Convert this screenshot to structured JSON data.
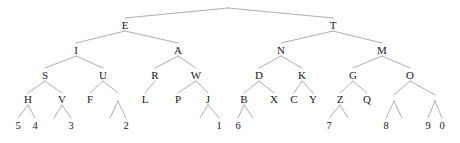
{
  "figure": {
    "type": "binary-tree-diagram",
    "width": 460,
    "height": 143,
    "background_color": "#ffffff",
    "edge_color": "#8b8b90",
    "text_color": "#16161a",
    "root_apex": {
      "x": 228,
      "y": 8
    },
    "levels_y": [
      8,
      25,
      50,
      75,
      99,
      125
    ],
    "nodes": [
      {
        "id": "E",
        "label": "E",
        "x": 125,
        "y": 25,
        "level": 1,
        "kind": "letter"
      },
      {
        "id": "T",
        "label": "T",
        "x": 333,
        "y": 25,
        "level": 1,
        "kind": "letter"
      },
      {
        "id": "I",
        "label": "I",
        "x": 76,
        "y": 50,
        "level": 2,
        "kind": "letter"
      },
      {
        "id": "A",
        "label": "A",
        "x": 178,
        "y": 50,
        "level": 2,
        "kind": "letter"
      },
      {
        "id": "N",
        "label": "N",
        "x": 281,
        "y": 50,
        "level": 2,
        "kind": "letter"
      },
      {
        "id": "M",
        "label": "M",
        "x": 382,
        "y": 50,
        "level": 2,
        "kind": "letter"
      },
      {
        "id": "S",
        "label": "S",
        "x": 45,
        "y": 75,
        "level": 3,
        "kind": "letter"
      },
      {
        "id": "U",
        "label": "U",
        "x": 103,
        "y": 75,
        "level": 3,
        "kind": "letter"
      },
      {
        "id": "R",
        "label": "R",
        "x": 155,
        "y": 75,
        "level": 3,
        "kind": "letter"
      },
      {
        "id": "W",
        "label": "W",
        "x": 196,
        "y": 75,
        "level": 3,
        "kind": "letter"
      },
      {
        "id": "D",
        "label": "D",
        "x": 259,
        "y": 75,
        "level": 3,
        "kind": "letter"
      },
      {
        "id": "K",
        "label": "K",
        "x": 302,
        "y": 75,
        "level": 3,
        "kind": "letter"
      },
      {
        "id": "G",
        "label": "G",
        "x": 353,
        "y": 75,
        "level": 3,
        "kind": "letter"
      },
      {
        "id": "O",
        "label": "O",
        "x": 410,
        "y": 75,
        "level": 3,
        "kind": "letter"
      },
      {
        "id": "H",
        "label": "H",
        "x": 28,
        "y": 99,
        "level": 4,
        "kind": "letter"
      },
      {
        "id": "V",
        "label": "V",
        "x": 62,
        "y": 99,
        "level": 4,
        "kind": "letter"
      },
      {
        "id": "F",
        "label": "F",
        "x": 90,
        "y": 99,
        "level": 4,
        "kind": "letter"
      },
      {
        "id": "n1",
        "label": "",
        "x": 118,
        "y": 99,
        "level": 4,
        "kind": "unlabeled"
      },
      {
        "id": "L",
        "label": "L",
        "x": 145,
        "y": 99,
        "level": 4,
        "kind": "letter"
      },
      {
        "id": "P",
        "label": "P",
        "x": 178,
        "y": 99,
        "level": 4,
        "kind": "letter"
      },
      {
        "id": "J",
        "label": "J",
        "x": 208,
        "y": 99,
        "level": 4,
        "kind": "letter"
      },
      {
        "id": "B",
        "label": "B",
        "x": 244,
        "y": 99,
        "level": 4,
        "kind": "letter"
      },
      {
        "id": "X",
        "label": "X",
        "x": 274,
        "y": 99,
        "level": 4,
        "kind": "letter"
      },
      {
        "id": "C",
        "label": "C",
        "x": 294,
        "y": 99,
        "level": 4,
        "kind": "letter"
      },
      {
        "id": "Y",
        "label": "Y",
        "x": 313,
        "y": 99,
        "level": 4,
        "kind": "letter"
      },
      {
        "id": "Z",
        "label": "Z",
        "x": 340,
        "y": 99,
        "level": 4,
        "kind": "letter"
      },
      {
        "id": "Q",
        "label": "Q",
        "x": 367,
        "y": 99,
        "level": 4,
        "kind": "letter"
      },
      {
        "id": "n2",
        "label": "",
        "x": 394,
        "y": 99,
        "level": 4,
        "kind": "unlabeled"
      },
      {
        "id": "n3",
        "label": "",
        "x": 435,
        "y": 99,
        "level": 4,
        "kind": "unlabeled"
      },
      {
        "id": "d5",
        "label": "5",
        "x": 18,
        "y": 125,
        "level": 5,
        "kind": "digit"
      },
      {
        "id": "d4",
        "label": "4",
        "x": 35,
        "y": 125,
        "level": 5,
        "kind": "digit"
      },
      {
        "id": "d3",
        "label": "3",
        "x": 71,
        "y": 125,
        "level": 5,
        "kind": "digit"
      },
      {
        "id": "d2",
        "label": "2",
        "x": 126,
        "y": 125,
        "level": 5,
        "kind": "digit"
      },
      {
        "id": "d1",
        "label": "1",
        "x": 219,
        "y": 125,
        "level": 5,
        "kind": "digit"
      },
      {
        "id": "d6",
        "label": "6",
        "x": 238,
        "y": 125,
        "level": 5,
        "kind": "digit"
      },
      {
        "id": "d7",
        "label": "7",
        "x": 329,
        "y": 125,
        "level": 5,
        "kind": "digit"
      },
      {
        "id": "d8",
        "label": "8",
        "x": 386,
        "y": 125,
        "level": 5,
        "kind": "digit"
      },
      {
        "id": "d9",
        "label": "9",
        "x": 428,
        "y": 125,
        "level": 5,
        "kind": "digit"
      },
      {
        "id": "d0",
        "label": "0",
        "x": 442,
        "y": 125,
        "level": 5,
        "kind": "digit"
      }
    ],
    "edges": [
      {
        "from": "root",
        "to": "E",
        "x1": 228,
        "y1": 8,
        "x2": 125,
        "y2": 18
      },
      {
        "from": "root",
        "to": "T",
        "x1": 228,
        "y1": 8,
        "x2": 333,
        "y2": 18
      },
      {
        "from": "E",
        "to": "I",
        "x1": 125,
        "y1": 31,
        "x2": 76,
        "y2": 43
      },
      {
        "from": "E",
        "to": "A",
        "x1": 125,
        "y1": 31,
        "x2": 178,
        "y2": 43
      },
      {
        "from": "T",
        "to": "N",
        "x1": 333,
        "y1": 31,
        "x2": 281,
        "y2": 43
      },
      {
        "from": "T",
        "to": "M",
        "x1": 333,
        "y1": 31,
        "x2": 382,
        "y2": 43
      },
      {
        "from": "I",
        "to": "S",
        "x1": 76,
        "y1": 56,
        "x2": 45,
        "y2": 68
      },
      {
        "from": "I",
        "to": "U",
        "x1": 76,
        "y1": 56,
        "x2": 103,
        "y2": 68
      },
      {
        "from": "A",
        "to": "R",
        "x1": 178,
        "y1": 56,
        "x2": 155,
        "y2": 68
      },
      {
        "from": "A",
        "to": "W",
        "x1": 178,
        "y1": 56,
        "x2": 196,
        "y2": 68
      },
      {
        "from": "N",
        "to": "D",
        "x1": 281,
        "y1": 56,
        "x2": 259,
        "y2": 68
      },
      {
        "from": "N",
        "to": "K",
        "x1": 281,
        "y1": 56,
        "x2": 302,
        "y2": 68
      },
      {
        "from": "M",
        "to": "G",
        "x1": 382,
        "y1": 56,
        "x2": 353,
        "y2": 68
      },
      {
        "from": "M",
        "to": "O",
        "x1": 382,
        "y1": 56,
        "x2": 410,
        "y2": 68
      },
      {
        "from": "S",
        "to": "H",
        "x1": 45,
        "y1": 81,
        "x2": 28,
        "y2": 93
      },
      {
        "from": "S",
        "to": "V",
        "x1": 45,
        "y1": 81,
        "x2": 62,
        "y2": 93
      },
      {
        "from": "U",
        "to": "F",
        "x1": 103,
        "y1": 81,
        "x2": 90,
        "y2": 93
      },
      {
        "from": "U",
        "to": "n1",
        "x1": 103,
        "y1": 81,
        "x2": 118,
        "y2": 93
      },
      {
        "from": "R",
        "to": "L",
        "x1": 155,
        "y1": 81,
        "x2": 145,
        "y2": 93
      },
      {
        "from": "W",
        "to": "P",
        "x1": 196,
        "y1": 81,
        "x2": 178,
        "y2": 93
      },
      {
        "from": "W",
        "to": "J",
        "x1": 196,
        "y1": 81,
        "x2": 208,
        "y2": 93
      },
      {
        "from": "D",
        "to": "B",
        "x1": 259,
        "y1": 81,
        "x2": 244,
        "y2": 93
      },
      {
        "from": "D",
        "to": "X",
        "x1": 259,
        "y1": 81,
        "x2": 274,
        "y2": 93
      },
      {
        "from": "K",
        "to": "C",
        "x1": 302,
        "y1": 81,
        "x2": 294,
        "y2": 93
      },
      {
        "from": "K",
        "to": "Y",
        "x1": 302,
        "y1": 81,
        "x2": 313,
        "y2": 93
      },
      {
        "from": "G",
        "to": "Z",
        "x1": 353,
        "y1": 81,
        "x2": 340,
        "y2": 93
      },
      {
        "from": "G",
        "to": "Q",
        "x1": 353,
        "y1": 81,
        "x2": 367,
        "y2": 93
      },
      {
        "from": "O",
        "to": "n2",
        "x1": 410,
        "y1": 81,
        "x2": 394,
        "y2": 95
      },
      {
        "from": "O",
        "to": "n3",
        "x1": 410,
        "y1": 81,
        "x2": 435,
        "y2": 95
      },
      {
        "from": "H",
        "to": "d5",
        "x1": 28,
        "y1": 105,
        "x2": 18,
        "y2": 118
      },
      {
        "from": "H",
        "to": "d4",
        "x1": 28,
        "y1": 105,
        "x2": 35,
        "y2": 118
      },
      {
        "from": "V",
        "to": "d3",
        "x1": 62,
        "y1": 105,
        "x2": 71,
        "y2": 118
      },
      {
        "from": "V",
        "to": "vl",
        "x1": 62,
        "y1": 105,
        "x2": 54,
        "y2": 118
      },
      {
        "from": "n1",
        "to": "d2",
        "x1": 118,
        "y1": 101,
        "x2": 126,
        "y2": 118
      },
      {
        "from": "n1",
        "to": "nl",
        "x1": 118,
        "y1": 101,
        "x2": 110,
        "y2": 118
      },
      {
        "from": "J",
        "to": "d1",
        "x1": 208,
        "y1": 105,
        "x2": 219,
        "y2": 118
      },
      {
        "from": "J",
        "to": "jl",
        "x1": 208,
        "y1": 105,
        "x2": 200,
        "y2": 118
      },
      {
        "from": "B",
        "to": "d6",
        "x1": 244,
        "y1": 105,
        "x2": 238,
        "y2": 118
      },
      {
        "from": "B",
        "to": "br",
        "x1": 244,
        "y1": 105,
        "x2": 253,
        "y2": 118
      },
      {
        "from": "Z",
        "to": "d7",
        "x1": 340,
        "y1": 105,
        "x2": 329,
        "y2": 118
      },
      {
        "from": "Z",
        "to": "zr",
        "x1": 340,
        "y1": 105,
        "x2": 348,
        "y2": 118
      },
      {
        "from": "n2",
        "to": "d8",
        "x1": 394,
        "y1": 101,
        "x2": 386,
        "y2": 118
      },
      {
        "from": "n2",
        "to": "nr",
        "x1": 394,
        "y1": 101,
        "x2": 402,
        "y2": 118
      },
      {
        "from": "n3",
        "to": "d9",
        "x1": 435,
        "y1": 101,
        "x2": 428,
        "y2": 118
      },
      {
        "from": "n3",
        "to": "d0",
        "x1": 435,
        "y1": 101,
        "x2": 442,
        "y2": 118
      }
    ]
  }
}
